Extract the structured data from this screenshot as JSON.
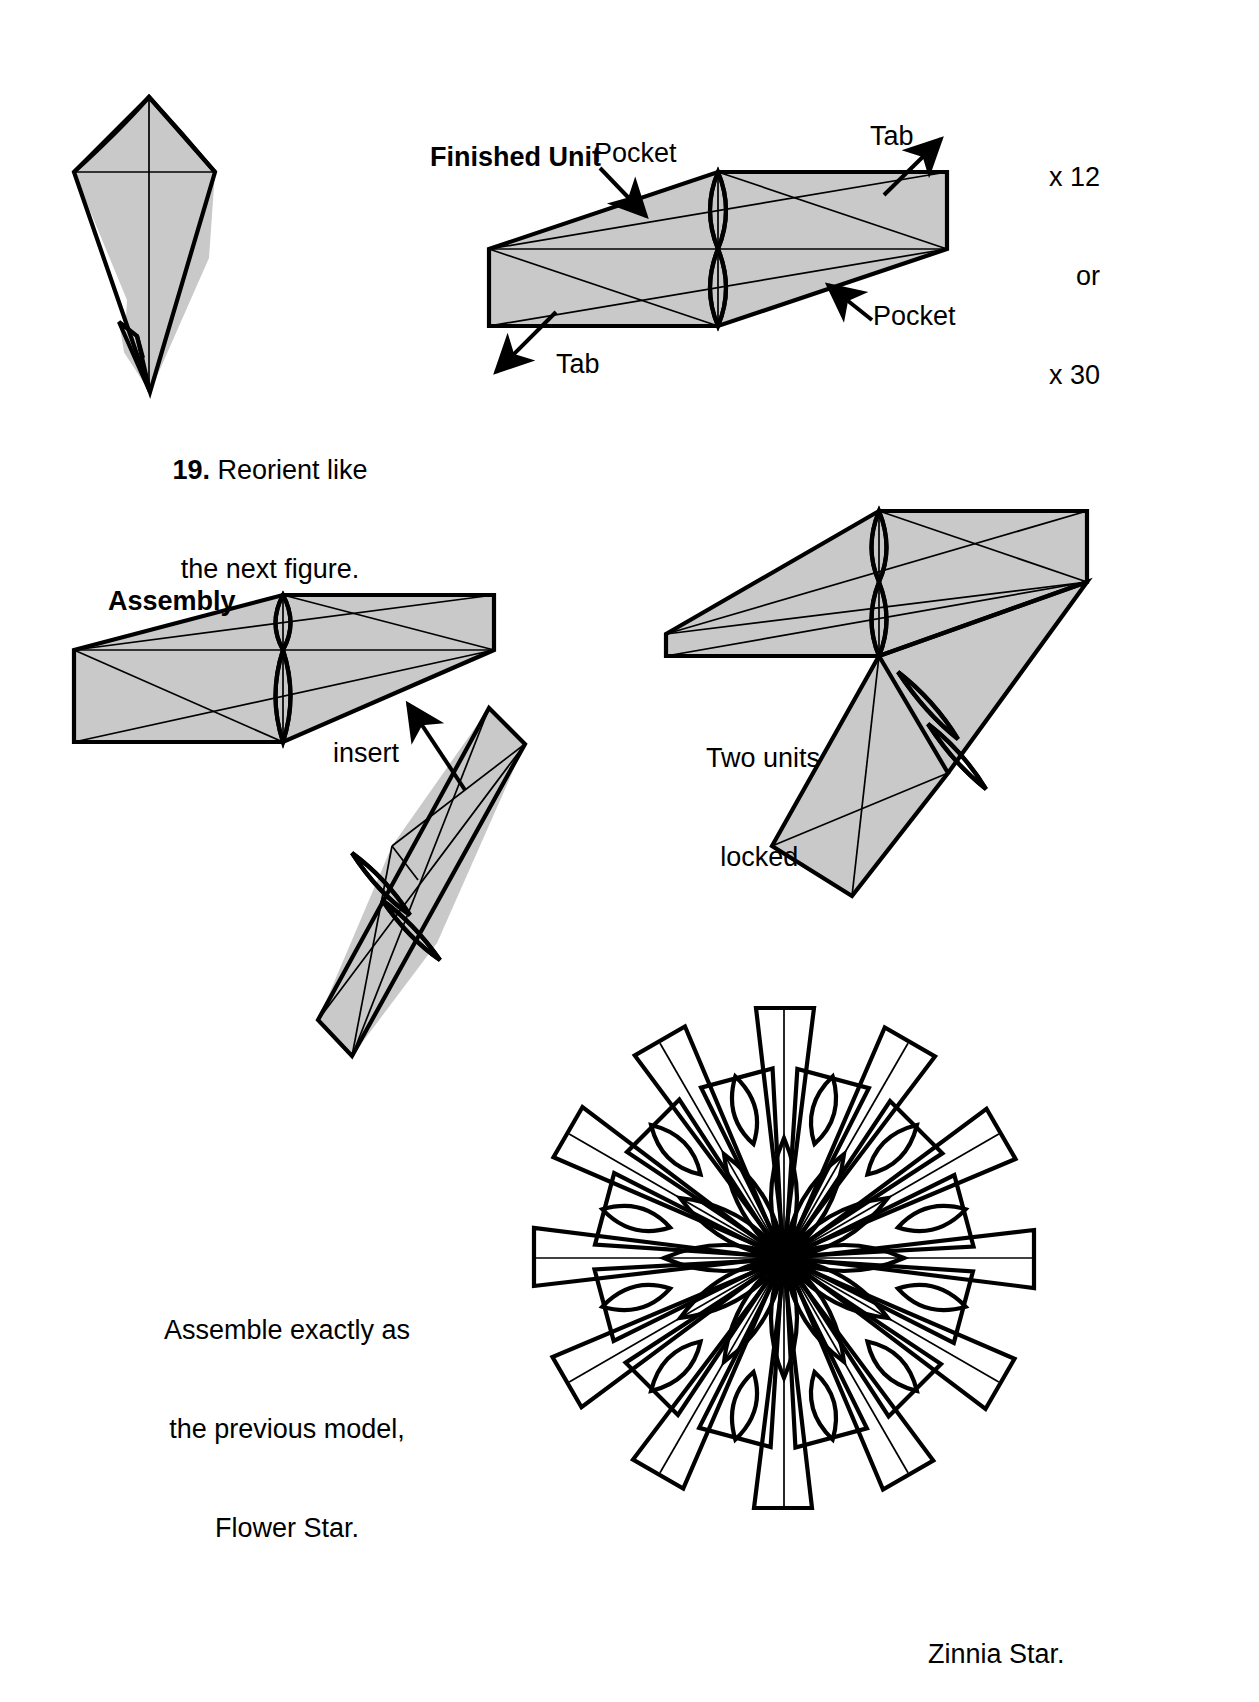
{
  "page": {
    "width": 1259,
    "height": 1702,
    "background_color": "#ffffff",
    "ink_color": "#000000",
    "paper_fill_color": "#c9c9c9",
    "paper_fill_light": "#d4d4d4"
  },
  "figures": {
    "step19": {
      "step_number": "19.",
      "caption_line1": "Reorient like",
      "caption_line2": "the next figure.",
      "shape_name": "kite-module-folded"
    },
    "finished_unit": {
      "heading": "Finished Unit",
      "labels": {
        "pocket_top": "Pocket",
        "pocket_bottom": "Pocket",
        "tab_top": "Tab",
        "tab_bottom": "Tab"
      },
      "quantity": {
        "line1": "x 12",
        "line2": "or",
        "line3": "x 30"
      }
    },
    "assembly": {
      "heading": "Assembly",
      "insert_label": "insert",
      "locked_caption_line1": "Two units",
      "locked_caption_line2": "locked."
    },
    "final_model": {
      "note_line1": "Assemble exactly as",
      "note_line2": "the previous model,",
      "note_line3": "Flower Star.",
      "caption": "Zinnia Star.",
      "points": 12
    }
  }
}
